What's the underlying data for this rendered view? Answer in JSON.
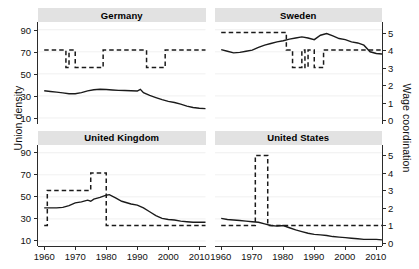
{
  "chart_data": {
    "type": "line",
    "title": "",
    "layout": {
      "facet_rows": 2,
      "facet_cols": 2,
      "grid": true,
      "legend": "none"
    },
    "xlabel": "",
    "ylabel": "Union density",
    "y2label": "Wage coordination",
    "xlim": [
      1958,
      2012
    ],
    "ylim": [
      5,
      97
    ],
    "y2lim": [
      -0.2,
      5.6
    ],
    "xticks": [
      1960,
      1970,
      1980,
      1990,
      2000,
      2010
    ],
    "yticks": [
      10,
      30,
      50,
      70,
      90
    ],
    "y2ticks": [
      0,
      1,
      2,
      3,
      4,
      5
    ],
    "series_styles": [
      {
        "name": "Union density",
        "line": "solid",
        "axis": "left",
        "color": "#1a1a1a"
      },
      {
        "name": "Wage coordination",
        "line": "dashed",
        "axis": "right",
        "color": "#1a1a1a"
      }
    ],
    "panels": [
      {
        "label": "Germany",
        "union_density": {
          "x": [
            1960,
            1962,
            1964,
            1966,
            1968,
            1970,
            1972,
            1974,
            1976,
            1978,
            1980,
            1982,
            1984,
            1986,
            1988,
            1990,
            1991,
            1992,
            1994,
            1996,
            1998,
            2000,
            2002,
            2004,
            2006,
            2008,
            2010,
            2012
          ],
          "y": [
            34.7,
            34.0,
            33.4,
            32.8,
            32.0,
            32.0,
            33.0,
            34.6,
            35.6,
            36.0,
            35.8,
            35.4,
            35.0,
            34.9,
            34.7,
            34.4,
            36.0,
            33.0,
            30.5,
            28.5,
            26.6,
            25.0,
            24.0,
            22.5,
            20.8,
            19.5,
            18.8,
            18.5
          ]
        },
        "wage_coordination": {
          "x": [
            1960,
            1966,
            1967,
            1968,
            1969,
            1970,
            1978,
            1979,
            1992,
            1993,
            1998,
            1999,
            2012
          ],
          "y": [
            4,
            4,
            3,
            4,
            4,
            3,
            3,
            4,
            4,
            3,
            3,
            4,
            4
          ]
        }
      },
      {
        "label": "Sweden",
        "union_density": {
          "x": [
            1960,
            1962,
            1964,
            1966,
            1968,
            1970,
            1972,
            1974,
            1976,
            1978,
            1980,
            1982,
            1984,
            1986,
            1988,
            1990,
            1992,
            1994,
            1996,
            1998,
            2000,
            2002,
            2004,
            2006,
            2008,
            2010,
            2012
          ],
          "y": [
            72.0,
            70.5,
            69.0,
            69.5,
            70.5,
            71.5,
            74.0,
            76.0,
            77.5,
            79.0,
            80.0,
            81.5,
            82.5,
            83.5,
            82.5,
            81.0,
            85.0,
            86.5,
            84.5,
            82.0,
            81.0,
            79.0,
            78.0,
            76.0,
            70.0,
            68.5,
            68.0
          ]
        },
        "wage_coordination": {
          "x": [
            1960,
            1980,
            1981,
            1982,
            1983,
            1985,
            1986,
            1987,
            1988,
            1989,
            1990,
            1992,
            1993,
            2000,
            2012
          ],
          "y": [
            5,
            5,
            4,
            4,
            3,
            3,
            4,
            3,
            4,
            4,
            3,
            3,
            4,
            4,
            4
          ]
        }
      },
      {
        "label": "United Kingdom",
        "union_density": {
          "x": [
            1960,
            1962,
            1964,
            1966,
            1968,
            1970,
            1972,
            1974,
            1975,
            1976,
            1978,
            1980,
            1981,
            1983,
            1985,
            1988,
            1990,
            1992,
            1994,
            1996,
            1998,
            2000,
            2002,
            2004,
            2006,
            2008,
            2010,
            2012
          ],
          "y": [
            40.0,
            40.0,
            40.0,
            40.5,
            42.0,
            44.5,
            45.5,
            47.0,
            46.0,
            48.0,
            49.5,
            51.5,
            52.0,
            49.0,
            46.0,
            43.5,
            42.5,
            40.0,
            36.5,
            33.0,
            30.5,
            29.5,
            29.0,
            28.0,
            27.5,
            27.0,
            27.0,
            27.0
          ]
        },
        "wage_coordination": {
          "x": [
            1960,
            1961,
            1974,
            1975,
            1979,
            1980,
            2012
          ],
          "y": [
            1,
            3,
            3,
            4,
            4,
            1,
            1
          ]
        }
      },
      {
        "label": "United States",
        "union_density": {
          "x": [
            1960,
            1962,
            1964,
            1966,
            1968,
            1970,
            1972,
            1974,
            1976,
            1978,
            1980,
            1982,
            1984,
            1986,
            1988,
            1990,
            1992,
            1994,
            1996,
            1998,
            2000,
            2002,
            2004,
            2006,
            2008,
            2010,
            2012
          ],
          "y": [
            30.5,
            29.5,
            29.0,
            28.5,
            28.0,
            27.5,
            27.0,
            25.5,
            24.0,
            23.5,
            24.0,
            22.0,
            20.0,
            18.5,
            17.0,
            16.0,
            15.5,
            15.0,
            14.0,
            13.5,
            13.0,
            12.5,
            12.0,
            11.5,
            11.5,
            11.5,
            11.0
          ]
        },
        "wage_coordination": {
          "x": [
            1960,
            1970,
            1971,
            1974,
            1975,
            2012
          ],
          "y": [
            1,
            1,
            5,
            5,
            1,
            1
          ]
        }
      }
    ]
  }
}
